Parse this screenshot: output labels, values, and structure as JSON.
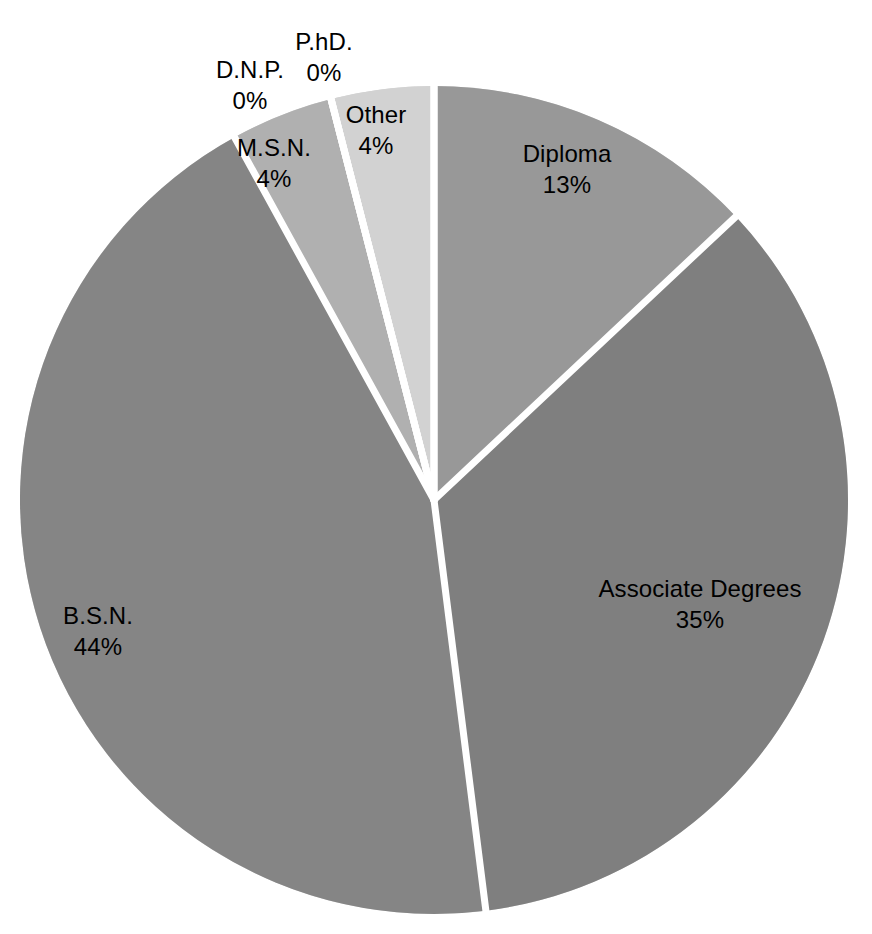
{
  "chart_data": {
    "type": "pie",
    "title": "",
    "subtitle": "",
    "xlabel": "",
    "ylabel": "",
    "legend_position": "none",
    "grid": false,
    "labels_show_name_and_percent": true,
    "start_angle_deg": 0,
    "direction": "clockwise",
    "categories": [
      "Diploma",
      "Associate Degrees",
      "B.S.N.",
      "M.S.N.",
      "D.N.P.",
      "P.hD.",
      "Other"
    ],
    "values": [
      13,
      35,
      44,
      4,
      0,
      0,
      4
    ],
    "percent_labels": [
      "13%",
      "35%",
      "44%",
      "4%",
      "0%",
      "0%",
      "4%"
    ],
    "slices": [
      {
        "name": "Diploma",
        "value": 13,
        "percent_label": "13%",
        "color": "#989898",
        "label_x": 567,
        "label_y": 170,
        "leader": false
      },
      {
        "name": "Associate Degrees",
        "value": 35,
        "percent_label": "35%",
        "color": "#7f7f7f",
        "label_x": 700,
        "label_y": 605,
        "leader": false
      },
      {
        "name": "B.S.N.",
        "value": 44,
        "percent_label": "44%",
        "color": "#858585",
        "label_x": 98,
        "label_y": 632,
        "leader": false
      },
      {
        "name": "M.S.N.",
        "value": 4,
        "percent_label": "4%",
        "color": "#b0b0b0",
        "label_x": 274,
        "label_y": 164,
        "leader": false
      },
      {
        "name": "D.N.P.",
        "value": 0,
        "percent_label": "0%",
        "color": "#c2c2c2",
        "label_x": 250,
        "label_y": 86,
        "leader": false
      },
      {
        "name": "P.hD.",
        "value": 0,
        "percent_label": "0%",
        "color": "#cacaca",
        "label_x": 324,
        "label_y": 58,
        "leader": false
      },
      {
        "name": "Other",
        "value": 4,
        "percent_label": "4%",
        "color": "#d2d2d2",
        "label_x": 376,
        "label_y": 131,
        "leader": false
      }
    ],
    "geometry": {
      "center_x": 434,
      "center_y": 500,
      "radius": 414,
      "separator_color": "#ffffff",
      "separator_width": 7
    },
    "background_color": "#ffffff"
  }
}
